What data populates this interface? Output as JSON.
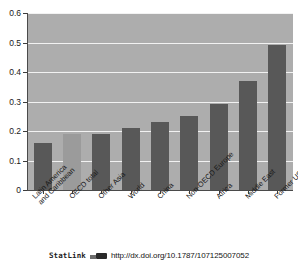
{
  "figure": {
    "background_color": "#ffffff",
    "plot_background_color": "#adadad",
    "bar_color": "#585858",
    "highlight_bar_color": "#9b9b9b",
    "gridline_color": "#f2f2f2",
    "axis_color": "#4a4a4a"
  },
  "chart_data": {
    "type": "bar",
    "title": "",
    "xlabel": "",
    "ylabel": "",
    "categories": [
      "Latin America and Caribbean",
      "OECD total",
      "Other Asia",
      "World",
      "China",
      "Non-OECD Europe",
      "Africa",
      "Middle East",
      "Former USSR"
    ],
    "category_lines": [
      [
        "Latin America",
        "and Caribbean"
      ],
      [
        "OECD total"
      ],
      [
        "Other Asia"
      ],
      [
        "World"
      ],
      [
        "China"
      ],
      [
        "Non-OECD Europe"
      ],
      [
        "Africa"
      ],
      [
        "Middle East"
      ],
      [
        "Former USSR"
      ]
    ],
    "values": [
      0.16,
      0.19,
      0.19,
      0.21,
      0.23,
      0.25,
      0.29,
      0.37,
      0.49
    ],
    "highlight_index": 1,
    "ylim": [
      0,
      0.6
    ],
    "ytick_labels": [
      "0.6",
      "0.5",
      "0.4",
      "0.3",
      "0.2",
      "0.1",
      "0"
    ],
    "ytick_values": [
      0.6,
      0.5,
      0.4,
      0.3,
      0.2,
      0.1,
      0
    ],
    "grid": true,
    "legend": "none"
  },
  "footer": {
    "statlink_label": "StatLink",
    "logo_icon": "statlink-logo-icon",
    "url": "http://dx.doi.org/10.1787/107125007052"
  }
}
